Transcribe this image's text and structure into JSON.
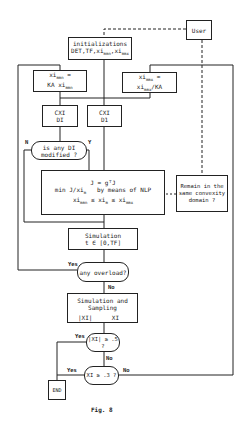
{
  "diagram": {
    "figure_caption": "Fig. 8",
    "nodes": {
      "user": {
        "label": "User"
      },
      "init": {
        "line1": "initializations",
        "line2": "DET,TF,xi",
        "sub1": "mmn",
        "sep": ",xi",
        "sub2": "mmx"
      },
      "xi_mmn": {
        "line1a": "xi",
        "line1sub": "mmn",
        "line1b": " =",
        "line2a": "KA xi",
        "line2sub": "mmn"
      },
      "xi_mmx": {
        "line1a": "xi",
        "line1sub": "mmx",
        "line1b": " =",
        "line2a": "xi",
        "line2sub": "mmx",
        "line2b": "/KA"
      },
      "cxi_left": {
        "line1": "CXI",
        "line2": "DI"
      },
      "cxi_right": {
        "line1": "CXI",
        "line2": "D1"
      },
      "di_modified": {
        "line1": "is any DI",
        "line2": "modified ?"
      },
      "nlp": {
        "line1": "J = gᵀJ",
        "line2a": "min J/xi",
        "line2sub": "m",
        "line2b": "   by means of NLP",
        "line3a": "xi",
        "line3sub1": "mmn",
        "line3b": " ≤ xi",
        "line3sub2": "m",
        "line3c": " ≤ xi",
        "line3sub3": "mmx"
      },
      "remain": {
        "line1": "Remain in the",
        "line2": "same convexity",
        "line3": "domain ?"
      },
      "simulation": {
        "line1": "Simulation",
        "line2": "t ∈ [0,TF]"
      },
      "overload": {
        "label": "any overload?"
      },
      "sim_sampling": {
        "line1": "Simulation and",
        "line2": "Sampling",
        "left": "|XI|",
        "right": "XI"
      },
      "xi_abs_check": {
        "label": "|XI| ≥ .5 ?"
      },
      "xi_check": {
        "label": "XI ≥ .3 ?"
      },
      "end": {
        "label": "END"
      }
    },
    "edge_labels": {
      "n": "N",
      "y": "Y",
      "overload_yes": "Yes",
      "overload_no": "No",
      "abs_yes": "Yes",
      "abs_no": "No",
      "xi_yes": "Yes",
      "xi_no": "No"
    }
  }
}
